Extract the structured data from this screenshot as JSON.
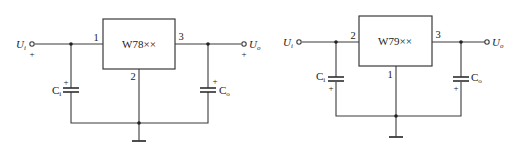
{
  "diagram": {
    "type": "circuit-schematic",
    "colors": {
      "line": "#3a3a3a",
      "background": "#ffffff"
    },
    "circuits": [
      {
        "id": "positive-regulator",
        "chip_label": "W78××",
        "pins": {
          "input": "1",
          "ground": "2",
          "output": "3"
        },
        "input_terminal": {
          "symbol": "U",
          "subscript": "i",
          "polarity": "+"
        },
        "output_terminal": {
          "symbol": "U",
          "subscript": "o",
          "polarity": "+"
        },
        "input_capacitor": {
          "symbol": "C",
          "subscript": "i",
          "polarity": "+",
          "polarity_position": "top"
        },
        "output_capacitor": {
          "symbol": "C",
          "subscript": "o",
          "polarity": "+",
          "polarity_position": "top"
        },
        "ground": "common"
      },
      {
        "id": "negative-regulator",
        "chip_label": "W79××",
        "pins": {
          "input": "2",
          "ground": "1",
          "output": "3"
        },
        "input_terminal": {
          "symbol": "U",
          "subscript": "i"
        },
        "output_terminal": {
          "symbol": "U",
          "subscript": "o"
        },
        "input_capacitor": {
          "symbol": "C",
          "subscript": "i",
          "polarity": "+",
          "polarity_position": "bottom"
        },
        "output_capacitor": {
          "symbol": "C",
          "subscript": "o",
          "polarity": "+",
          "polarity_position": "bottom"
        },
        "ground": "common"
      }
    ]
  }
}
